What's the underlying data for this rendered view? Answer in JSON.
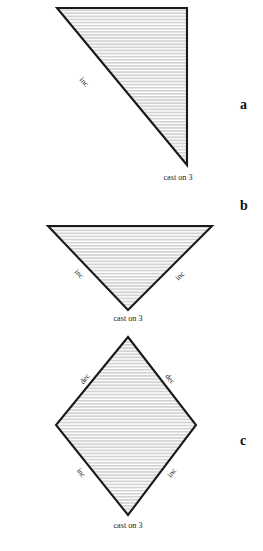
{
  "figure": {
    "background_color": "#ffffff",
    "outline_color": "#1a1a1a",
    "stripe_color": "#d3d3d3",
    "fill_color": "#ffffff",
    "panels": [
      {
        "letter": "a",
        "shape": "right-triangle",
        "cast_on_label": "cast on 3",
        "edge_labels": [
          {
            "text": "inc",
            "edge": "hypotenuse-left"
          }
        ]
      },
      {
        "letter": "b",
        "shape": "inverted-triangle",
        "cast_on_label": "cast on 3",
        "edge_labels": [
          {
            "text": "inc",
            "edge": "lower-left"
          },
          {
            "text": "inc",
            "edge": "lower-right"
          }
        ]
      },
      {
        "letter": "c",
        "shape": "diamond",
        "cast_on_label": "cast on 3",
        "edge_labels": [
          {
            "text": "dec",
            "edge": "upper-left"
          },
          {
            "text": "dec",
            "edge": "upper-right"
          },
          {
            "text": "inc",
            "edge": "lower-left"
          },
          {
            "text": "inc",
            "edge": "lower-right"
          }
        ]
      }
    ]
  }
}
